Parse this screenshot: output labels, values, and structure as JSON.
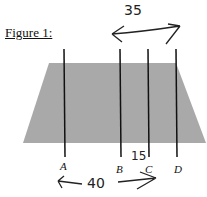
{
  "figure": {
    "title": "Figure 1:",
    "shape": "trapezoid",
    "fill_color": "#a9a9a9",
    "lines": [
      {
        "label": "A",
        "x": 64
      },
      {
        "label": "B",
        "x": 120
      },
      {
        "label": "C",
        "x": 149
      },
      {
        "label": "D",
        "x": 177
      }
    ],
    "annotations": {
      "top_measure": "35",
      "middle_measure": "15",
      "bottom_measure": "40"
    }
  }
}
